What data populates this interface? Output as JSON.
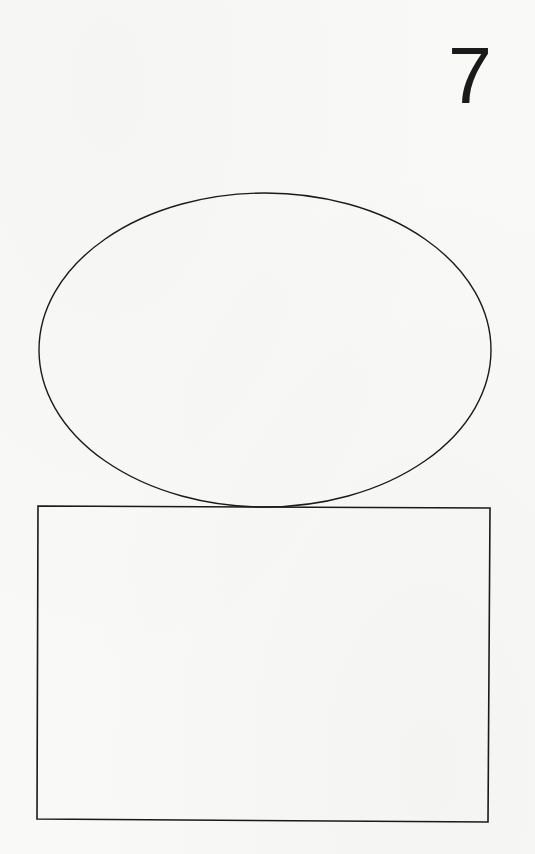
{
  "page": {
    "page_number": "7",
    "background_color": "#f9f9f8",
    "ink_color": "#1a1a1a"
  },
  "figures": {
    "ellipse": {
      "shape": "ellipse",
      "cx": 265,
      "cy": 350,
      "rx": 226,
      "ry": 157,
      "stroke": "#1a1a1a",
      "stroke_width": 1.4,
      "fill": "none"
    },
    "rectangle": {
      "shape": "rectangle",
      "points": "38,506 490,508 488,822 37,819",
      "stroke": "#1a1a1a",
      "stroke_width": 1.6,
      "fill": "none"
    }
  }
}
